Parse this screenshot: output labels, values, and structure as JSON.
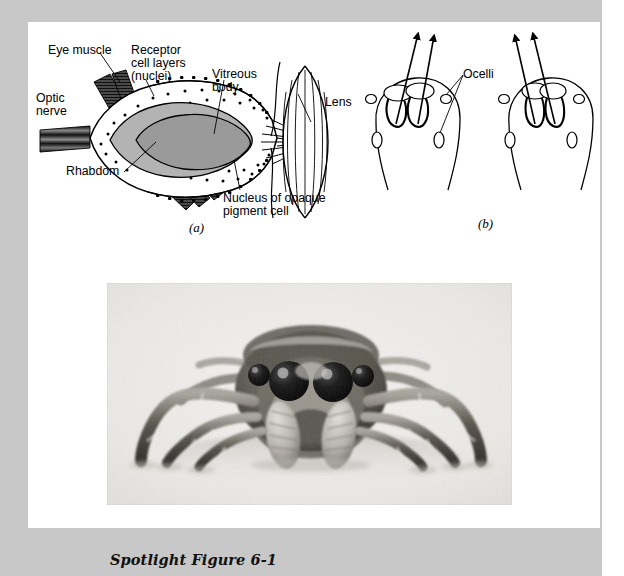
{
  "figure": {
    "caption": "Spotlight Figure 6-1",
    "panel_a_letter": "(a)",
    "panel_b_letter": "(b)"
  },
  "panel_a": {
    "name": "anterior-median-eye-longitudinal-section",
    "labels": {
      "eye_muscle": "Eye muscle",
      "receptor_cell_layers_l1": "Receptor",
      "receptor_cell_layers_l2": "cell layers",
      "receptor_cell_layers_l3": "(nuclei)",
      "vitreous_body_l1": "Vitreous",
      "vitreous_body_l2": "body",
      "lens": "Lens",
      "optic_nerve_l1": "Optic",
      "optic_nerve_l2": "nerve",
      "rhabdom": "Rhabdom",
      "nucleus_opaque_pigment_l1": "Nucleus of opaque",
      "nucleus_opaque_pigment_l2": "pigment cell"
    }
  },
  "panel_b": {
    "name": "ocelli-eye-tube-movement-diagrams",
    "labels": {
      "ocelli": "Ocelli"
    },
    "diagrams": [
      {
        "name": "eye-tubes-diverged",
        "gaze": "diverged"
      },
      {
        "name": "eye-tubes-converged",
        "gaze": "converged"
      }
    ]
  },
  "photo": {
    "name": "jumping-spider-frontal-photograph",
    "subject": "jumping spider front view"
  },
  "colors": {
    "page_background": "#c8c8c8",
    "panel_background": "#ffffff",
    "ink": "#000000",
    "retina_fill": "#b3b3b3",
    "rhabdom_fill": "#9a9a9a",
    "muscle_fill": "#555555"
  }
}
